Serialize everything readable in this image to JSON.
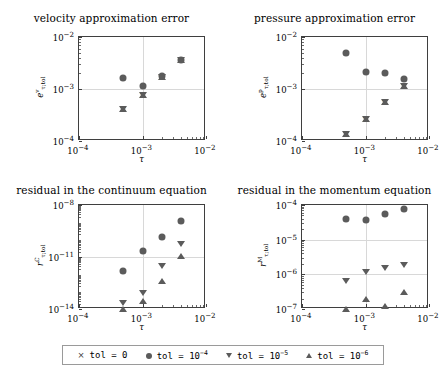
{
  "figure": {
    "width": 446,
    "height": 377,
    "marker_color": "#5b5b5b",
    "axis_color": "#3f3f3f",
    "grid_color": "#d8d8d8"
  },
  "legend": {
    "entries": [
      {
        "marker": "cross-marker",
        "label_prefix": "tol = 0",
        "base": "",
        "exponent": ""
      },
      {
        "marker": "circle-marker",
        "label_prefix": "tol = 10",
        "base": "10",
        "exponent": "-4"
      },
      {
        "marker": "triangle-down-marker",
        "label_prefix": "tol = 10",
        "base": "10",
        "exponent": "-5"
      },
      {
        "marker": "triangle-up-marker",
        "label_prefix": "tol = 10",
        "base": "10",
        "exponent": "-6"
      }
    ],
    "texts": [
      "tol = 0",
      "tol = 10-4",
      "tol = 10-5",
      "tol = 10-6"
    ]
  },
  "chart_data": [
    {
      "type": "scatter",
      "panel": "top-left",
      "title": "velocity approximation error",
      "xlabel": "τ",
      "ylabel": "e^v_{τ;tol}",
      "ylabel_base": "e",
      "ylabel_sup": "v",
      "ylabel_sub": "τ;tol",
      "xscale": "log",
      "yscale": "log",
      "xlim": [
        0.0001,
        0.01
      ],
      "ylim": [
        0.0001,
        0.01
      ],
      "xticks": [
        0.0001,
        0.001,
        0.01
      ],
      "xticklabels": [
        "10-4",
        "10-3",
        "10-2"
      ],
      "yticks": [
        0.0001,
        0.001,
        0.01
      ],
      "yticklabels": [
        "10-4",
        "10-3",
        "10-2"
      ],
      "grid": true,
      "x": [
        0.0005,
        0.001,
        0.002,
        0.004
      ],
      "series": [
        {
          "name": "tol = 0",
          "marker": "cross",
          "values": [
            0.00042,
            0.00077,
            0.00169,
            0.0036
          ]
        },
        {
          "name": "tol = 1e-4",
          "marker": "circle",
          "values": [
            0.00165,
            0.00115,
            0.0018,
            0.0036
          ]
        },
        {
          "name": "tol = 1e-5",
          "marker": "triangle-down",
          "values": [
            0.00042,
            0.00077,
            0.00169,
            0.0036
          ]
        },
        {
          "name": "tol = 1e-6",
          "marker": "triangle-up",
          "values": [
            0.00042,
            0.00077,
            0.00169,
            0.0036
          ]
        }
      ]
    },
    {
      "type": "scatter",
      "panel": "top-right",
      "title": "pressure approximation error",
      "xlabel": "τ",
      "ylabel": "e^p_{τ;tol}",
      "ylabel_base": "e",
      "ylabel_sup": "p",
      "ylabel_sub": "τ;tol",
      "xscale": "log",
      "yscale": "log",
      "xlim": [
        0.0001,
        0.01
      ],
      "ylim": [
        0.0001,
        0.01
      ],
      "xticks": [
        0.0001,
        0.001,
        0.01
      ],
      "xticklabels": [
        "10-4",
        "10-3",
        "10-2"
      ],
      "yticks": [
        0.0001,
        0.001,
        0.01
      ],
      "yticklabels": [
        "10-4",
        "10-3",
        "10-2"
      ],
      "grid": true,
      "x": [
        0.0005,
        0.001,
        0.002,
        0.004
      ],
      "series": [
        {
          "name": "tol = 0",
          "marker": "cross",
          "values": [
            0.000135,
            0.00027,
            0.00056,
            0.00115
          ]
        },
        {
          "name": "tol = 1e-4",
          "marker": "circle",
          "values": [
            0.0049,
            0.0021,
            0.002,
            0.00155
          ]
        },
        {
          "name": "tol = 1e-5",
          "marker": "triangle-down",
          "values": [
            0.000135,
            0.00027,
            0.00056,
            0.00115
          ]
        },
        {
          "name": "tol = 1e-6",
          "marker": "triangle-up",
          "values": [
            0.000135,
            0.00027,
            0.00056,
            0.00115
          ]
        }
      ]
    },
    {
      "type": "scatter",
      "panel": "bottom-left",
      "title": "residual in the continuum equation",
      "xlabel": "τ",
      "ylabel": "r^C_{τ;tol}",
      "ylabel_base": "r",
      "ylabel_sup": "C",
      "ylabel_sub": "τ;tol",
      "xscale": "log",
      "yscale": "log",
      "xlim": [
        0.0001,
        0.01
      ],
      "ylim": [
        1e-14,
        1e-08
      ],
      "xticks": [
        0.0001,
        0.001,
        0.01
      ],
      "xticklabels": [
        "10-4",
        "10-3",
        "10-2"
      ],
      "yticks": [
        1e-14,
        1e-11,
        1e-08
      ],
      "yticklabels": [
        "10-14",
        "10-11",
        "10-8"
      ],
      "grid": true,
      "x": [
        0.0005,
        0.001,
        0.002,
        0.004
      ],
      "series": [
        {
          "name": "tol = 1e-4",
          "marker": "circle",
          "values": [
            1.6e-12,
            2.2e-11,
            1.4e-10,
            1.2e-09
          ]
        },
        {
          "name": "tol = 1e-5",
          "marker": "triangle-down",
          "values": [
            2.2e-14,
            8e-14,
            3e-12,
            6e-11
          ]
        },
        {
          "name": "tol = 1e-6",
          "marker": "triangle-up",
          "values": [
            1e-14,
            2.8e-14,
            4e-13,
            1.1e-11
          ]
        }
      ]
    },
    {
      "type": "scatter",
      "panel": "bottom-right",
      "title": "residual in the momentum equation",
      "xlabel": "τ",
      "ylabel": "r^M_{τ;tol}",
      "ylabel_base": "r",
      "ylabel_sup": "M",
      "ylabel_sub": "τ;tol",
      "xscale": "log",
      "yscale": "log",
      "xlim": [
        0.0001,
        0.01
      ],
      "ylim": [
        1e-07,
        0.0001
      ],
      "xticks": [
        0.0001,
        0.001,
        0.01
      ],
      "xticklabels": [
        "10-4",
        "10-3",
        "10-2"
      ],
      "yticks": [
        1e-07,
        1e-06,
        1e-05,
        0.0001
      ],
      "yticklabels": [
        "10-7",
        "10-6",
        "10-5",
        "10-4"
      ],
      "grid": true,
      "x": [
        0.0005,
        0.001,
        0.002,
        0.004
      ],
      "series": [
        {
          "name": "tol = 1e-4",
          "marker": "circle",
          "values": [
            3.9e-05,
            3.8e-05,
            5.6e-05,
            7.5e-05
          ]
        },
        {
          "name": "tol = 1e-5",
          "marker": "triangle-down",
          "values": [
            6.5e-07,
            1.15e-06,
            1.5e-06,
            1.9e-06
          ]
        },
        {
          "name": "tol = 1e-6",
          "marker": "triangle-up",
          "values": [
            1e-07,
            2e-07,
            1.2e-07,
            3e-07
          ]
        }
      ]
    }
  ]
}
